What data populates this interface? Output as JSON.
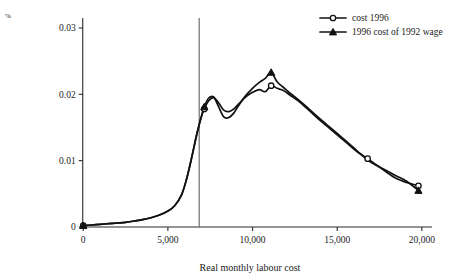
{
  "chart_data": {
    "type": "line",
    "title": "",
    "xlabel": "Real monthly labour cost",
    "ylabel": "%",
    "xlim": [
      -900,
      20600
    ],
    "ylim": [
      0,
      0.0315
    ],
    "grid": false,
    "legend_position": "top-right",
    "xticks": [
      0,
      5000,
      10000,
      15000,
      20000
    ],
    "xtick_labels": [
      "0",
      "5,000",
      "10,000",
      "15,000",
      "20,000"
    ],
    "yticks": [
      0,
      0.01,
      0.02,
      0.03
    ],
    "ytick_labels": [
      "0",
      "0.01",
      "0.02",
      "0.03"
    ],
    "annotations": [
      {
        "type": "vertical-line",
        "x": 6850,
        "label": ""
      }
    ],
    "series": [
      {
        "name": "cost 1996",
        "marker": "open-circle",
        "x": [
          0,
          500,
          1000,
          1500,
          2000,
          2500,
          3000,
          3500,
          4000,
          4500,
          5000,
          5400,
          5800,
          6100,
          6400,
          6700,
          6950,
          7150,
          7400,
          7700,
          8000,
          8300,
          8600,
          8900,
          9200,
          9600,
          10000,
          10400,
          10750,
          11100,
          11450,
          11800,
          12200,
          12700,
          13200,
          13800,
          14400,
          15000,
          15600,
          16200,
          16800,
          17300,
          17900,
          18500,
          19100,
          19800
        ],
        "y": [
          0.0002,
          0.0003,
          0.0004,
          0.0005,
          0.0006,
          0.0007,
          0.0009,
          0.0011,
          0.0014,
          0.0018,
          0.0024,
          0.0032,
          0.0048,
          0.0072,
          0.0104,
          0.0139,
          0.0164,
          0.0178,
          0.019,
          0.0195,
          0.0187,
          0.0176,
          0.0174,
          0.0178,
          0.0186,
          0.0196,
          0.0203,
          0.0207,
          0.0204,
          0.0213,
          0.0209,
          0.0206,
          0.0199,
          0.019,
          0.0179,
          0.0165,
          0.0152,
          0.0139,
          0.0126,
          0.0113,
          0.0103,
          0.0094,
          0.0083,
          0.0073,
          0.0067,
          0.0062
        ]
      },
      {
        "name": "1996 cost of 1992 wage",
        "marker": "filled-triangle",
        "x": [
          0,
          500,
          1000,
          1500,
          2000,
          2500,
          3000,
          3500,
          4000,
          4500,
          5000,
          5400,
          5800,
          6100,
          6400,
          6700,
          6950,
          7150,
          7400,
          7700,
          8000,
          8300,
          8600,
          8900,
          9200,
          9600,
          10000,
          10400,
          10750,
          11100,
          11450,
          11800,
          12200,
          12700,
          13200,
          13800,
          14400,
          15000,
          15600,
          16200,
          16800,
          17300,
          17900,
          18500,
          19100,
          19800
        ],
        "y": [
          0.0002,
          0.0003,
          0.0004,
          0.0005,
          0.0006,
          0.0007,
          0.0009,
          0.0011,
          0.0014,
          0.0018,
          0.0024,
          0.0032,
          0.0048,
          0.0072,
          0.0104,
          0.0139,
          0.0164,
          0.0181,
          0.0194,
          0.0196,
          0.0181,
          0.0166,
          0.0165,
          0.0172,
          0.0184,
          0.0198,
          0.0209,
          0.0218,
          0.0224,
          0.0233,
          0.0219,
          0.0211,
          0.0202,
          0.0192,
          0.0181,
          0.0167,
          0.0154,
          0.0141,
          0.0128,
          0.0114,
          0.0101,
          0.0093,
          0.0085,
          0.0077,
          0.0069,
          0.0055
        ]
      }
    ],
    "markers": [
      {
        "series": 0,
        "x": 0,
        "y": 0.0002
      },
      {
        "series": 0,
        "x": 7150,
        "y": 0.0178
      },
      {
        "series": 0,
        "x": 11100,
        "y": 0.0213
      },
      {
        "series": 0,
        "x": 16800,
        "y": 0.0103
      },
      {
        "series": 0,
        "x": 19800,
        "y": 0.0062
      },
      {
        "series": 1,
        "x": 0,
        "y": 0.0002
      },
      {
        "series": 1,
        "x": 7150,
        "y": 0.0181
      },
      {
        "series": 1,
        "x": 11100,
        "y": 0.0233
      },
      {
        "series": 1,
        "x": 19800,
        "y": 0.0055
      }
    ]
  },
  "legend": {
    "entries": [
      {
        "label": "cost 1996",
        "marker": "open-circle"
      },
      {
        "label": "1996 cost of 1992 wage",
        "marker": "filled-triangle"
      }
    ]
  }
}
